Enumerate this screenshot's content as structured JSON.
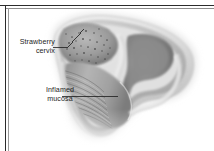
{
  "figure": {
    "title": "Strawberry cervix",
    "width": 214,
    "height": 151,
    "background_color": "#ffffff",
    "border_color": "#2c2c2c",
    "ink_color": "#1d1d1d"
  },
  "labels": [
    {
      "id": "strawberry-cervix",
      "line1": "Strawberry",
      "line2": "cervix",
      "leader": "angled-up-right"
    },
    {
      "id": "inflamed-mucosa",
      "line1": "Inflamed",
      "line2": "mucosa",
      "leader": "horizontal-right"
    }
  ],
  "illustration": {
    "palette": {
      "outer_wall_light": "#e3e3e3",
      "outer_wall_mid": "#c9c9c9",
      "wall_shadow": "#a6a6a6",
      "cervix_body": "#9e9e9e",
      "cervix_dark": "#7d7d7d",
      "canal_mid": "#b2b2b2",
      "canal_shadow": "#8a8a8a",
      "cavity_dark": "#6f6f6f",
      "stipple": "#4a4a4a",
      "highlight": "#f2f2f2"
    },
    "features": [
      "punctate stippling on cervix surface",
      "horizontal rugae ridges in vaginal canal",
      "layered tissue walls",
      "soft blurred outer margin fading to white"
    ]
  }
}
